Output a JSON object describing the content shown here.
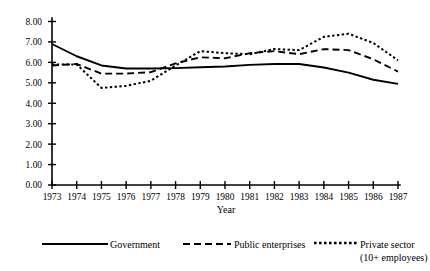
{
  "chart_data": {
    "type": "line",
    "title": "",
    "subtitle": "",
    "xlabel": "Year",
    "ylabel": "",
    "grid": false,
    "legend_position": "bottom",
    "x": [
      1973,
      1974,
      1975,
      1976,
      1977,
      1978,
      1979,
      1980,
      1981,
      1982,
      1983,
      1984,
      1985,
      1986,
      1987
    ],
    "categories": [
      "1973",
      "1974",
      "1975",
      "1976",
      "1977",
      "1978",
      "1979",
      "1980",
      "1981",
      "1982",
      "1983",
      "1984",
      "1985",
      "1986",
      "1987"
    ],
    "xlim": [
      1973,
      1987
    ],
    "ylim": [
      0.0,
      8.0
    ],
    "y_ticks": [
      "0.00",
      "1.00",
      "2.00",
      "3.00",
      "4.00",
      "5.00",
      "6.00",
      "7.00",
      "8.00"
    ],
    "y_tick_values": [
      0.0,
      1.0,
      2.0,
      3.0,
      4.0,
      5.0,
      6.0,
      7.0,
      8.0
    ],
    "x_ticks": [
      "1973",
      "1974",
      "1975",
      "1976",
      "1977",
      "1978",
      "1979",
      "1980",
      "1981",
      "1982",
      "1983",
      "1984",
      "1985",
      "1986",
      "1987"
    ],
    "series": [
      {
        "name": "Government",
        "style": "solid",
        "values": [
          6.9,
          6.3,
          5.85,
          5.7,
          5.7,
          5.72,
          5.76,
          5.8,
          5.88,
          5.92,
          5.92,
          5.75,
          5.5,
          5.15,
          4.95
        ]
      },
      {
        "name": "Public enterprises",
        "style": "dashed",
        "values": [
          5.85,
          5.92,
          5.45,
          5.45,
          5.52,
          5.95,
          6.25,
          6.2,
          6.45,
          6.55,
          6.4,
          6.65,
          6.6,
          6.15,
          5.55
        ]
      },
      {
        "name": "Private sector (10+ employees)",
        "style": "dotted",
        "values": [
          5.9,
          5.9,
          4.75,
          4.85,
          5.1,
          5.85,
          6.55,
          6.45,
          6.4,
          6.65,
          6.6,
          7.25,
          7.4,
          6.95,
          6.1
        ]
      }
    ]
  },
  "legend": {
    "items": [
      {
        "label": "Government",
        "style": "solid"
      },
      {
        "label": "Public enterprises",
        "style": "dashed"
      },
      {
        "label": "Private sector",
        "label2": "(10+ employees)",
        "style": "dotted"
      }
    ]
  },
  "colors": {
    "line": "#000000",
    "axis": "#000000",
    "background": "#ffffff"
  }
}
